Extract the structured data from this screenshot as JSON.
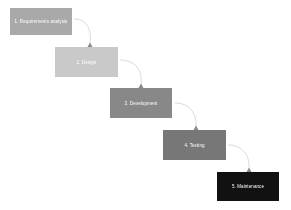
{
  "diagram": {
    "type": "waterfall",
    "steps": [
      {
        "label": "1. Requirements analysis",
        "color": "#a9a9a9",
        "x": 10,
        "y": 8,
        "w": 62,
        "h": 27
      },
      {
        "label": "2. Design",
        "color": "#c9c9c9",
        "x": 55,
        "y": 47,
        "w": 63,
        "h": 30
      },
      {
        "label": "3. Development",
        "color": "#888888",
        "x": 110,
        "y": 88,
        "w": 62,
        "h": 30
      },
      {
        "label": "4. Testing",
        "color": "#777777",
        "x": 163,
        "y": 130,
        "w": 63,
        "h": 30
      },
      {
        "label": "5. Maintenance",
        "color": "#111111",
        "x": 217,
        "y": 172,
        "w": 62,
        "h": 29
      }
    ],
    "connector_color": "#cfcfcf",
    "arrowhead_color": "#8a8a8a"
  }
}
